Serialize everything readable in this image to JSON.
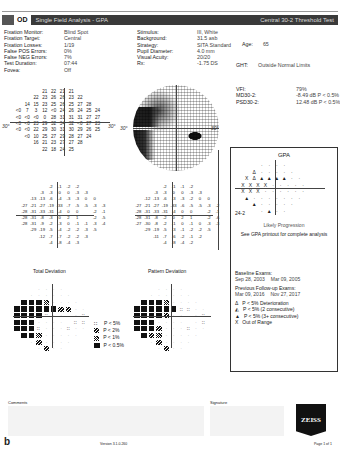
{
  "header": {
    "eye": "OD",
    "title": "Single Field Analysis - GPA",
    "test": "Central 30-2 Threshold Test"
  },
  "reliability": [
    {
      "label": "Fixation Monitor:",
      "value": "Blind Spot"
    },
    {
      "label": "Fixation Target:",
      "value": "Central"
    },
    {
      "label": "Fixation Losses:",
      "value": "1/19"
    },
    {
      "label": "False POS Errors:",
      "value": "0%"
    },
    {
      "label": "False NEG Errors:",
      "value": "7%"
    },
    {
      "label": "Test Duration:",
      "value": "07:44"
    },
    {
      "label": "Fovea:",
      "value": "Off"
    }
  ],
  "stimulus": [
    {
      "label": "Stimulus:",
      "value": "III, White"
    },
    {
      "label": "Background:",
      "value": "31.5 asb"
    },
    {
      "label": "Strategy:",
      "value": "SITA Standard"
    },
    {
      "label": "Pupil Diameter:",
      "value": "4.0 mm"
    },
    {
      "label": "Visual Acuity:",
      "value": "20/20"
    },
    {
      "label": "Rx:",
      "value": "-1.75 DS"
    }
  ],
  "patient": {
    "age_label": "Age:",
    "age": "65"
  },
  "ght": {
    "label": "GHT:",
    "value": "Outside Normal Limits"
  },
  "indices": [
    {
      "label": "VFI:",
      "value": "79%"
    },
    {
      "label": "MD30-2:",
      "value": "-8.49 dB P < 0.5%"
    },
    {
      "label": "PSD30-2:",
      "value": "12.48 dB P < 0.5%"
    }
  ],
  "degree_label": "30°",
  "threshold_values": [
    [
      "21",
      "22",
      "21",
      "21"
    ],
    [
      "22",
      "23",
      "26",
      "26",
      "23",
      "22"
    ],
    [
      "14",
      "15",
      "23",
      "25",
      "26",
      "25",
      "27",
      "28"
    ],
    [
      "<0",
      "7",
      "3",
      "12",
      "<0",
      "24",
      "26",
      "24",
      "25",
      "24"
    ],
    [
      "<0",
      "<0",
      "<0",
      "0",
      "28",
      "31",
      "31",
      "31",
      "27",
      "27"
    ],
    [
      "<0",
      "<0",
      "23",
      "29",
      "32",
      "34",
      "32",
      "<0",
      "27",
      "23"
    ],
    [
      "<0",
      "<0",
      "22",
      "29",
      "30",
      "31",
      "30",
      "29",
      "26",
      "25"
    ],
    [
      "<0",
      "10",
      "25",
      "27",
      "29",
      "28",
      "27",
      "24"
    ],
    [
      "16",
      "21",
      "23",
      "27",
      "27",
      "28"
    ],
    [
      "22",
      "18",
      "24",
      "25"
    ]
  ],
  "total_deviation_values": [
    [
      "-2",
      "-1",
      "-2",
      "-2"
    ],
    [
      "-3",
      "-3",
      "0",
      "0",
      "-3",
      "-3"
    ],
    [
      "-13",
      "-13",
      "-6",
      "-4",
      "-3",
      "-3",
      "0",
      "0"
    ],
    [
      "-27",
      "-21",
      "-27",
      "-19",
      "-33",
      "-7",
      "-5",
      "-5",
      "-3",
      "-3"
    ],
    [
      "-28",
      "-31",
      "-33",
      "-31",
      "-4",
      "0",
      "0",
      "",
      "-2",
      "-1"
    ],
    [
      "-28",
      "-31",
      "-8",
      "-3",
      "0",
      "2",
      "1",
      "",
      "-2",
      "-5"
    ],
    [
      "-28",
      "-31",
      "-9",
      "-2",
      "-3",
      "0",
      "-1",
      "-1",
      "-3",
      "-4"
    ],
    [
      "-29",
      "-19",
      "-5",
      "-4",
      "-2",
      "-2",
      "-3",
      "-5"
    ],
    [
      "-12",
      "-7",
      "-7",
      "-2",
      "-2",
      "-3"
    ],
    [
      "-4",
      "-8",
      "-4",
      "-3"
    ]
  ],
  "pattern_deviation_values": [
    [
      "-2",
      "-1",
      "-1",
      "-2"
    ],
    [
      "-3",
      "-3",
      "0",
      "0",
      "-3",
      "-3"
    ],
    [
      "-12",
      "-13",
      "-6",
      "-3",
      "-3",
      "-2",
      "0",
      "0"
    ],
    [
      "-27",
      "-21",
      "-27",
      "-19",
      "-33",
      "-6",
      "-5",
      "-5",
      "-3",
      "-2"
    ],
    [
      "-28",
      "-31",
      "-33",
      "-31",
      "-4",
      "0",
      "0",
      "",
      "-2",
      "-1"
    ],
    [
      "-28",
      "-31",
      "-8",
      "-2",
      "0",
      "2",
      "1",
      "",
      "-2",
      "-6"
    ],
    [
      "-27",
      "-30",
      "-8",
      "-2",
      "-1",
      "0",
      "-1",
      "0",
      "-3",
      "-3"
    ],
    [
      "-29",
      "-19",
      "-5",
      "-3",
      "-1",
      "-2",
      "-2",
      "-5"
    ],
    [
      "-11",
      "-7",
      "-6",
      "-2",
      "-1",
      "-2"
    ],
    [
      "-4",
      "-8",
      "-4",
      "-2"
    ]
  ],
  "total_deviation_title": "Total Deviation",
  "pattern_deviation_title": "Pattern Deviation",
  "total_deviation_map": [
    [
      "s",
      "s",
      "s",
      "s"
    ],
    [
      "s",
      "s",
      "s",
      "s",
      "s",
      "s"
    ],
    [
      "b",
      "b",
      "b",
      "m",
      "s",
      "s",
      "s",
      "s"
    ],
    [
      "b",
      "b",
      "b",
      "b",
      "b",
      "b",
      "h",
      "h",
      "s",
      "s"
    ],
    [
      "b",
      "b",
      "b",
      "b",
      "d",
      "s",
      "s",
      "",
      "s",
      "d"
    ],
    [
      "b",
      "b",
      "b",
      "s",
      "s",
      "s",
      "s",
      "",
      "d",
      "d"
    ],
    [
      "b",
      "b",
      "b",
      "d",
      "s",
      "s",
      "s",
      "d",
      "s",
      "s"
    ],
    [
      "b",
      "b",
      "m",
      "s",
      "s",
      "s",
      "s",
      "s"
    ],
    [
      "s",
      "h",
      "s",
      "s",
      "s",
      "s"
    ],
    [
      "s",
      "h",
      "s",
      "s"
    ]
  ],
  "pattern_deviation_map": [
    [
      "s",
      "s",
      "s",
      "s"
    ],
    [
      "s",
      "s",
      "s",
      "s",
      "s",
      "s"
    ],
    [
      "b",
      "b",
      "b",
      "m",
      "s",
      "s",
      "s",
      "s"
    ],
    [
      "b",
      "b",
      "b",
      "b",
      "b",
      "b",
      "d",
      "d",
      "s",
      "s"
    ],
    [
      "b",
      "b",
      "b",
      "b",
      "h",
      "s",
      "s",
      "",
      "s",
      "d"
    ],
    [
      "b",
      "b",
      "b",
      "s",
      "s",
      "s",
      "s",
      "",
      "s",
      "d"
    ],
    [
      "b",
      "b",
      "b",
      "h",
      "s",
      "s",
      "s",
      "d",
      "s",
      "s"
    ],
    [
      "b",
      "h",
      "m",
      "s",
      "s",
      "s",
      "s",
      "s"
    ],
    [
      "s",
      "h",
      "s",
      "s",
      "s",
      "s"
    ],
    [
      "s",
      "h",
      "s",
      "s"
    ]
  ],
  "prob_legend": [
    {
      "symbol": "dots",
      "label": "P < 5%"
    },
    {
      "symbol": "hatch",
      "label": "P < 2%"
    },
    {
      "symbol": "checker",
      "label": "P < 1%"
    },
    {
      "symbol": "solid",
      "label": "P < 0.5%"
    }
  ],
  "gpa": {
    "title": "GPA",
    "grid": [
      [
        "·",
        "·",
        "·",
        "·"
      ],
      [
        "Δ",
        "·",
        "·",
        "·",
        "·",
        "·"
      ],
      [
        "X",
        "Δ",
        "▲",
        "▲",
        "▲",
        "▲",
        "·",
        "·"
      ],
      [
        "X",
        "X",
        "X",
        "X",
        "·",
        "·",
        "·",
        "·",
        "·"
      ],
      [
        "X",
        "X",
        "X",
        "·",
        "·",
        "·",
        "·",
        "·",
        "·"
      ],
      [
        "▲",
        "·",
        "·",
        "·",
        "·",
        "·",
        "·",
        "·"
      ],
      [
        "▲",
        "·",
        "·",
        "·",
        "·",
        "·"
      ],
      [
        "·",
        "▲",
        "·",
        "·"
      ]
    ],
    "program": "24-2",
    "status": "Likely Progression",
    "note": "See GPA printout for complete analysis",
    "baseline_label": "Baseline Exams:",
    "baseline_dates": [
      "Sep 28, 2003",
      "Mar 09, 2005"
    ],
    "followup_label": "Previous Follow-up Exams:",
    "followup_dates": [
      "Mar 09, 2016",
      "Nov 27, 2017"
    ],
    "legend": [
      {
        "symbol": "Δ",
        "label": "P < 5% Deterioration"
      },
      {
        "symbol": "◭",
        "label": "P < 5% (2 consecutive)"
      },
      {
        "symbol": "▲",
        "label": "P < 5% (3+ consecutive)"
      },
      {
        "symbol": "X",
        "label": "Out of Range"
      }
    ]
  },
  "footer": {
    "comments_label": "Comments",
    "signature_label": "Signature",
    "logo": "ZEISS",
    "figure_label": "b",
    "version": "Version 3.1.0.260",
    "page": "Page 1 of 1"
  }
}
